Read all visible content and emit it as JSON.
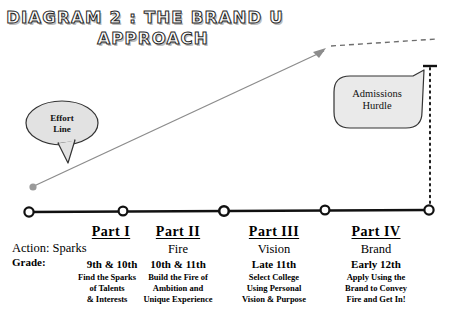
{
  "title": {
    "line1": "DIAGRAM 2 : THE BRAND U",
    "line2": "APPROACH"
  },
  "callouts": {
    "effort": {
      "label_line1": "Effort",
      "label_line2": "Line",
      "fill": "#e2e2e2",
      "stroke": "#333333"
    },
    "hurdle": {
      "label_line1": "Admissions",
      "label_line2": "Hurdle",
      "fill": "#eaeaea",
      "stroke": "#333333"
    }
  },
  "effort_line": {
    "color": "#8c8c8c",
    "dash_color": "#6e6e6e",
    "start_dot_color": "#9a9a9a"
  },
  "timeline": {
    "line_color": "#111111",
    "node_fill": "#ffffff",
    "node_stroke": "#111111",
    "nodes": 5
  },
  "hurdle_line": {
    "color": "#111111",
    "style": "dotted"
  },
  "parts": [
    {
      "heading": "Part I",
      "stage": "Sparks",
      "grade": "9th & 10th",
      "detail_lines": [
        "Find the Sparks",
        "of Talents",
        "& Interests"
      ],
      "action_label": "Action: Sparks",
      "grade_label": "Grade:"
    },
    {
      "heading": "Part II",
      "stage": "Fire",
      "grade": "10th & 11th",
      "detail_lines": [
        "Build the Fire of",
        "Ambition and",
        "Unique Experience"
      ]
    },
    {
      "heading": "Part III",
      "stage": "Vision",
      "grade": "Late 11th",
      "detail_lines": [
        "Select College",
        "Using Personal",
        "Vision & Purpose"
      ]
    },
    {
      "heading": "Part IV",
      "stage": "Brand",
      "grade": "Early 12th",
      "detail_lines": [
        "Apply Using the",
        "Brand to Convey",
        "Fire and Get In!"
      ]
    }
  ]
}
